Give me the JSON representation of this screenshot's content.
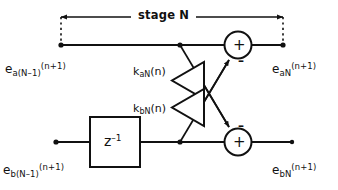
{
  "diagram": {
    "stage_bracket": {
      "label": "stage N",
      "left_arrow": "←",
      "right_arrow": "→"
    },
    "signals": {
      "input_a": {
        "base": "e",
        "sub": "a(N–1)",
        "sup": "(n+1)",
        "full": "e_a(N-1)^(n+1)"
      },
      "output_a": {
        "base": "e",
        "sub": "aN",
        "sup": "(n+1)",
        "full": "e_aN^(n+1)"
      },
      "input_b": {
        "base": "e",
        "sub": "b(N–1)",
        "sup": "(n+1)",
        "full": "e_b(N-1)^(n+1)"
      },
      "output_b": {
        "base": "e",
        "sub": "bN",
        "sup": "(n+1)",
        "full": "e_bN^(n+1)"
      }
    },
    "gains": {
      "upper": {
        "base": "k",
        "sub": "aN",
        "tail": "(n)",
        "full": "k_aN(n)"
      },
      "lower": {
        "base": "k",
        "sub": "bN",
        "tail": "(n)",
        "full": "k_bN(n)"
      }
    },
    "delay_block": {
      "base": "z",
      "sup": "–1",
      "full": "z^-1"
    },
    "adders": {
      "upper": {
        "inside": "+",
        "port_sign": "–"
      },
      "lower": {
        "inside": "+",
        "port_sign": "–"
      }
    },
    "colors": {
      "line": "#111111",
      "background": "#ffffff",
      "text": "#111111"
    }
  }
}
